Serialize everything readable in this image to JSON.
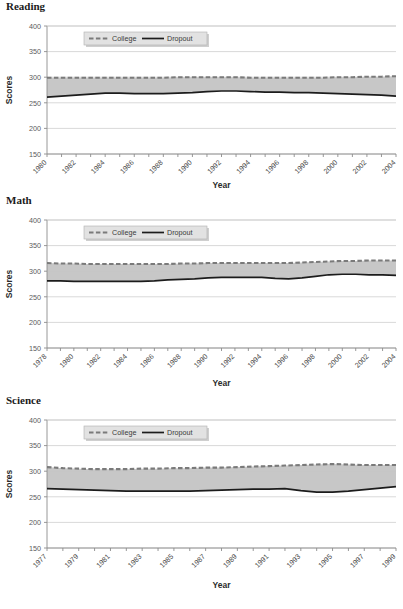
{
  "page": {
    "top_partial_text": "",
    "background_color": "#ffffff"
  },
  "colors": {
    "band_fill": "#c4c4c4",
    "college_line": "#7a7a7a",
    "dropout_line": "#1c1c1c",
    "gridline": "#c9c9c9",
    "axis": "#8c8c8c",
    "legend_bg": "#e2e2e2"
  },
  "legend": {
    "college_label": "College",
    "dropout_label": "Dropout"
  },
  "axis_titles": {
    "y": "Scores",
    "x": "Year"
  },
  "panels": [
    {
      "title": "Reading"
    },
    {
      "title": "Math"
    },
    {
      "title": "Science"
    }
  ],
  "chart_data": [
    {
      "type": "line",
      "title": "Reading",
      "xlabel": "Year",
      "ylabel": "Scores",
      "ylim": [
        150,
        400
      ],
      "yticks": [
        150,
        200,
        250,
        300,
        350,
        400
      ],
      "xticks": [
        1980,
        1982,
        1984,
        1986,
        1988,
        1990,
        1992,
        1994,
        1996,
        1998,
        2000,
        2002,
        2004
      ],
      "xlim": [
        1980,
        2004
      ],
      "grid": true,
      "legend_position": "top-left-inside",
      "x": [
        1980,
        1981,
        1982,
        1983,
        1984,
        1985,
        1986,
        1987,
        1988,
        1989,
        1990,
        1991,
        1992,
        1993,
        1994,
        1995,
        1996,
        1997,
        1998,
        1999,
        2000,
        2001,
        2002,
        2003,
        2004
      ],
      "series": [
        {
          "name": "College",
          "style": "dashed",
          "values": [
            299,
            299,
            299,
            299,
            299,
            299,
            299,
            299,
            299,
            300,
            300,
            300,
            300,
            300,
            299,
            299,
            299,
            299,
            299,
            299,
            300,
            300,
            301,
            301,
            302
          ]
        },
        {
          "name": "Dropout",
          "style": "solid",
          "values": [
            261,
            263,
            265,
            267,
            269,
            269,
            268,
            268,
            268,
            269,
            270,
            272,
            273,
            273,
            272,
            271,
            271,
            270,
            270,
            269,
            268,
            267,
            266,
            265,
            263
          ]
        }
      ]
    },
    {
      "type": "line",
      "title": "Math",
      "xlabel": "Year",
      "ylabel": "Scores",
      "ylim": [
        150,
        400
      ],
      "yticks": [
        150,
        200,
        250,
        300,
        350,
        400
      ],
      "xticks": [
        1978,
        1980,
        1982,
        1984,
        1986,
        1988,
        1990,
        1992,
        1994,
        1996,
        1998,
        2000,
        2002,
        2004
      ],
      "xlim": [
        1978,
        2004
      ],
      "grid": true,
      "legend_position": "top-left-inside",
      "x": [
        1978,
        1979,
        1980,
        1981,
        1982,
        1983,
        1984,
        1985,
        1986,
        1987,
        1988,
        1989,
        1990,
        1991,
        1992,
        1993,
        1994,
        1995,
        1996,
        1997,
        1998,
        1999,
        2000,
        2001,
        2002,
        2003,
        2004
      ],
      "series": [
        {
          "name": "College",
          "style": "dashed",
          "values": [
            316,
            315,
            315,
            314,
            314,
            314,
            314,
            314,
            314,
            314,
            315,
            315,
            316,
            316,
            316,
            316,
            316,
            316,
            316,
            317,
            318,
            319,
            320,
            320,
            321,
            321,
            321
          ]
        },
        {
          "name": "Dropout",
          "style": "solid",
          "values": [
            281,
            281,
            280,
            280,
            280,
            280,
            280,
            280,
            281,
            283,
            284,
            285,
            287,
            288,
            288,
            288,
            288,
            286,
            285,
            287,
            290,
            293,
            294,
            294,
            293,
            293,
            292
          ]
        }
      ]
    },
    {
      "type": "line",
      "title": "Science",
      "xlabel": "Year",
      "ylabel": "Scores",
      "ylim": [
        150,
        400
      ],
      "yticks": [
        150,
        200,
        250,
        300,
        350,
        400
      ],
      "xticks": [
        1977,
        1979,
        1981,
        1983,
        1985,
        1987,
        1989,
        1991,
        1993,
        1995,
        1997,
        1999
      ],
      "xlim": [
        1977,
        1999
      ],
      "grid": true,
      "legend_position": "top-left-inside",
      "x": [
        1977,
        1978,
        1979,
        1980,
        1981,
        1982,
        1983,
        1984,
        1985,
        1986,
        1987,
        1988,
        1989,
        1990,
        1991,
        1992,
        1993,
        1994,
        1995,
        1996,
        1997,
        1998,
        1999
      ],
      "series": [
        {
          "name": "College",
          "style": "dashed",
          "values": [
            308,
            306,
            305,
            304,
            304,
            304,
            305,
            305,
            306,
            306,
            307,
            307,
            308,
            309,
            310,
            311,
            312,
            313,
            314,
            313,
            312,
            312,
            312
          ]
        },
        {
          "name": "Dropout",
          "style": "solid",
          "values": [
            266,
            265,
            264,
            263,
            262,
            261,
            261,
            261,
            261,
            261,
            262,
            263,
            264,
            265,
            265,
            266,
            262,
            259,
            259,
            261,
            264,
            267,
            270
          ]
        }
      ]
    }
  ]
}
